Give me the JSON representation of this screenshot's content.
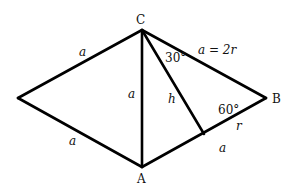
{
  "diagram": {
    "vertices": {
      "C": {
        "label": "C",
        "x": 142,
        "y": 30
      },
      "B": {
        "label": "B",
        "x": 266,
        "y": 98
      },
      "A": {
        "label": "A",
        "x": 142,
        "y": 167
      },
      "L": {
        "label": "",
        "x": 18,
        "y": 98
      },
      "F": {
        "label": "",
        "x": 204,
        "y": 134
      }
    },
    "edges": [
      {
        "from": "C",
        "to": "L"
      },
      {
        "from": "L",
        "to": "A"
      },
      {
        "from": "C",
        "to": "A"
      },
      {
        "from": "C",
        "to": "B"
      },
      {
        "from": "A",
        "to": "B"
      },
      {
        "from": "C",
        "to": "F"
      }
    ],
    "labels": {
      "upper_left_side": "a",
      "lower_left_side": "a",
      "middle_side": "a",
      "height": "h",
      "right_upper_side": "a = 2r",
      "angle_at_C": "30°",
      "angle_at_B": "60°",
      "segment_r": "r",
      "segment_a": "a"
    }
  }
}
